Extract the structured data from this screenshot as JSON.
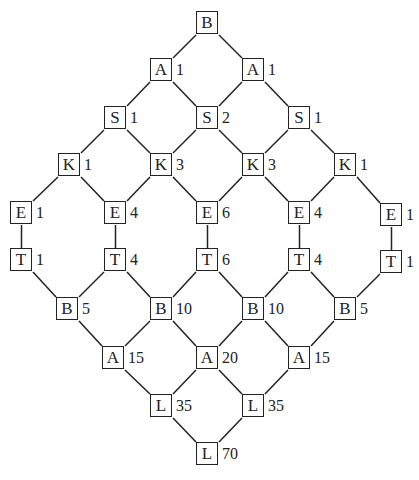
{
  "diagram": {
    "type": "lattice",
    "nodes": [
      {
        "id": "r0c0",
        "letter": "B",
        "count": "",
        "x": 196,
        "y": 11
      },
      {
        "id": "r1c0",
        "letter": "A",
        "count": "1",
        "x": 150,
        "y": 58
      },
      {
        "id": "r1c1",
        "letter": "A",
        "count": "1",
        "x": 242,
        "y": 58
      },
      {
        "id": "r2c0",
        "letter": "S",
        "count": "1",
        "x": 104,
        "y": 106
      },
      {
        "id": "r2c1",
        "letter": "S",
        "count": "2",
        "x": 196,
        "y": 106
      },
      {
        "id": "r2c2",
        "letter": "S",
        "count": "1",
        "x": 288,
        "y": 106
      },
      {
        "id": "r3c0",
        "letter": "K",
        "count": "1",
        "x": 58,
        "y": 153
      },
      {
        "id": "r3c1",
        "letter": "K",
        "count": "3",
        "x": 150,
        "y": 153
      },
      {
        "id": "r3c2",
        "letter": "K",
        "count": "3",
        "x": 242,
        "y": 153
      },
      {
        "id": "r3c3",
        "letter": "K",
        "count": "1",
        "x": 334,
        "y": 153
      },
      {
        "id": "r4c0",
        "letter": "E",
        "count": "1",
        "x": 10,
        "y": 201
      },
      {
        "id": "r4c1",
        "letter": "E",
        "count": "4",
        "x": 104,
        "y": 201
      },
      {
        "id": "r4c2",
        "letter": "E",
        "count": "6",
        "x": 196,
        "y": 201
      },
      {
        "id": "r4c3",
        "letter": "E",
        "count": "4",
        "x": 288,
        "y": 201
      },
      {
        "id": "r4c4",
        "letter": "E",
        "count": "1",
        "x": 380,
        "y": 203
      },
      {
        "id": "r5c0",
        "letter": "T",
        "count": "1",
        "x": 10,
        "y": 248
      },
      {
        "id": "r5c1",
        "letter": "T",
        "count": "4",
        "x": 104,
        "y": 248
      },
      {
        "id": "r5c2",
        "letter": "T",
        "count": "6",
        "x": 196,
        "y": 248
      },
      {
        "id": "r5c3",
        "letter": "T",
        "count": "4",
        "x": 288,
        "y": 248
      },
      {
        "id": "r5c4",
        "letter": "T",
        "count": "1",
        "x": 380,
        "y": 250
      },
      {
        "id": "r6c0",
        "letter": "B",
        "count": "5",
        "x": 56,
        "y": 297
      },
      {
        "id": "r6c1",
        "letter": "B",
        "count": "10",
        "x": 150,
        "y": 297
      },
      {
        "id": "r6c2",
        "letter": "B",
        "count": "10",
        "x": 242,
        "y": 297
      },
      {
        "id": "r6c3",
        "letter": "B",
        "count": "5",
        "x": 334,
        "y": 297
      },
      {
        "id": "r7c0",
        "letter": "A",
        "count": "15",
        "x": 102,
        "y": 346
      },
      {
        "id": "r7c1",
        "letter": "A",
        "count": "20",
        "x": 196,
        "y": 346
      },
      {
        "id": "r7c2",
        "letter": "A",
        "count": "15",
        "x": 288,
        "y": 346
      },
      {
        "id": "r8c0",
        "letter": "L",
        "count": "35",
        "x": 150,
        "y": 394
      },
      {
        "id": "r8c1",
        "letter": "L",
        "count": "35",
        "x": 242,
        "y": 394
      },
      {
        "id": "r9c0",
        "letter": "L",
        "count": "70",
        "x": 196,
        "y": 442
      }
    ],
    "edges": [
      [
        "r0c0",
        "r1c0"
      ],
      [
        "r0c0",
        "r1c1"
      ],
      [
        "r1c0",
        "r2c0"
      ],
      [
        "r1c0",
        "r2c1"
      ],
      [
        "r1c1",
        "r2c1"
      ],
      [
        "r1c1",
        "r2c2"
      ],
      [
        "r2c0",
        "r3c0"
      ],
      [
        "r2c0",
        "r3c1"
      ],
      [
        "r2c1",
        "r3c1"
      ],
      [
        "r2c1",
        "r3c2"
      ],
      [
        "r2c2",
        "r3c2"
      ],
      [
        "r2c2",
        "r3c3"
      ],
      [
        "r3c0",
        "r4c0"
      ],
      [
        "r3c0",
        "r4c1"
      ],
      [
        "r3c1",
        "r4c1"
      ],
      [
        "r3c1",
        "r4c2"
      ],
      [
        "r3c2",
        "r4c2"
      ],
      [
        "r3c2",
        "r4c3"
      ],
      [
        "r3c3",
        "r4c3"
      ],
      [
        "r3c3",
        "r4c4"
      ],
      [
        "r4c0",
        "r5c0"
      ],
      [
        "r4c1",
        "r5c1"
      ],
      [
        "r4c2",
        "r5c2"
      ],
      [
        "r4c3",
        "r5c3"
      ],
      [
        "r4c4",
        "r5c4"
      ],
      [
        "r5c0",
        "r6c0"
      ],
      [
        "r5c1",
        "r6c0"
      ],
      [
        "r5c1",
        "r6c1"
      ],
      [
        "r5c2",
        "r6c1"
      ],
      [
        "r5c2",
        "r6c2"
      ],
      [
        "r5c3",
        "r6c2"
      ],
      [
        "r5c3",
        "r6c3"
      ],
      [
        "r5c4",
        "r6c3"
      ],
      [
        "r6c0",
        "r7c0"
      ],
      [
        "r6c1",
        "r7c0"
      ],
      [
        "r6c1",
        "r7c1"
      ],
      [
        "r6c2",
        "r7c1"
      ],
      [
        "r6c2",
        "r7c2"
      ],
      [
        "r6c3",
        "r7c2"
      ],
      [
        "r7c0",
        "r8c0"
      ],
      [
        "r7c1",
        "r8c0"
      ],
      [
        "r7c1",
        "r8c1"
      ],
      [
        "r7c2",
        "r8c1"
      ],
      [
        "r8c0",
        "r9c0"
      ],
      [
        "r8c1",
        "r9c0"
      ]
    ],
    "colors": {
      "line": "#222222",
      "box_fill": "#ffffff",
      "text": "#222222"
    }
  }
}
